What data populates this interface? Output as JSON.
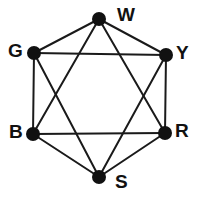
{
  "diagram": {
    "type": "graph",
    "title": "",
    "canvas": {
      "width": 198,
      "height": 199
    },
    "background_color": "#ffffff",
    "vertex_color": "#111111",
    "edge_color": "#1a1a1a",
    "label_color": "#111111",
    "vertex_radius": 7,
    "edge_width": 2,
    "vertices": [
      {
        "id": "W",
        "label": "W",
        "x": 99,
        "y": 19,
        "label_x": 117,
        "label_y": 5
      },
      {
        "id": "G",
        "label": "G",
        "x": 34,
        "y": 53,
        "label_x": 8,
        "label_y": 41
      },
      {
        "id": "Y",
        "label": "Y",
        "x": 166,
        "y": 55,
        "label_x": 176,
        "label_y": 43
      },
      {
        "id": "B",
        "label": "B",
        "x": 33,
        "y": 134,
        "label_x": 9,
        "label_y": 122
      },
      {
        "id": "R",
        "label": "R",
        "x": 165,
        "y": 133,
        "label_x": 175,
        "label_y": 121
      },
      {
        "id": "S",
        "label": "S",
        "x": 99,
        "y": 177,
        "label_x": 115,
        "label_y": 172
      }
    ],
    "edges": [
      {
        "from": "W",
        "to": "G",
        "kind": "perimeter"
      },
      {
        "from": "W",
        "to": "Y",
        "kind": "perimeter"
      },
      {
        "from": "G",
        "to": "B",
        "kind": "perimeter"
      },
      {
        "from": "Y",
        "to": "R",
        "kind": "perimeter"
      },
      {
        "from": "B",
        "to": "S",
        "kind": "perimeter"
      },
      {
        "from": "R",
        "to": "S",
        "kind": "perimeter"
      },
      {
        "from": "G",
        "to": "Y",
        "kind": "chord"
      },
      {
        "from": "B",
        "to": "R",
        "kind": "chord"
      },
      {
        "from": "W",
        "to": "B",
        "kind": "chord"
      },
      {
        "from": "W",
        "to": "R",
        "kind": "chord"
      },
      {
        "from": "G",
        "to": "S",
        "kind": "chord"
      },
      {
        "from": "Y",
        "to": "S",
        "kind": "chord"
      }
    ],
    "edge_count": 12,
    "vertex_count": 6
  }
}
